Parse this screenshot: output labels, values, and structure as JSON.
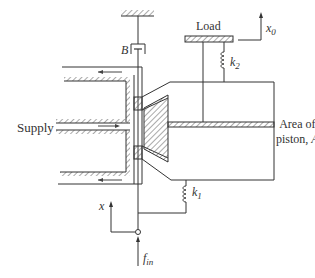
{
  "diagram": {
    "type": "schematic",
    "labels": {
      "supply": "Supply",
      "load": "Load",
      "damper": "B",
      "spring_top": "k",
      "spring_top_sub": "2",
      "spring_bottom": "k",
      "spring_bottom_sub": "1",
      "output_disp": "x",
      "output_disp_sub": "0",
      "input_disp": "x",
      "input_force": "f",
      "input_force_sub": "in",
      "piston_area_line1": "Area of",
      "piston_area_line2": "piston, ",
      "piston_area_symbol": "A"
    },
    "colors": {
      "line": "#333333",
      "hatch": "#555555",
      "flow_arrow": "#444444",
      "background": "#ffffff"
    }
  }
}
